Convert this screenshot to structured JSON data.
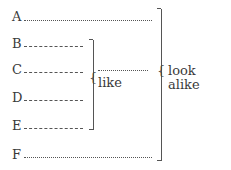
{
  "items": [
    {
      "letter": "A",
      "line": "dotted"
    },
    {
      "letter": "B",
      "line": "dashed"
    },
    {
      "letter": "C",
      "line": "dashed"
    },
    {
      "letter": "D",
      "line": "dashed"
    },
    {
      "letter": "E",
      "line": "dashed"
    },
    {
      "letter": "F",
      "line": "dotted"
    }
  ],
  "inner_group": {
    "label": "like",
    "brace": "{",
    "members": [
      "B",
      "C",
      "D",
      "E"
    ]
  },
  "outer_group": {
    "label": "look alike",
    "brace": "{",
    "members": [
      "A",
      "like-group",
      "F"
    ]
  }
}
